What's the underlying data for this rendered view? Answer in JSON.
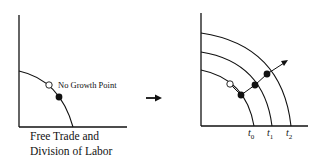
{
  "left_panel": {
    "point_label": "No Growth Point",
    "caption_line1": "Free Trade and",
    "caption_line2": "Division of Labor"
  },
  "right_panel": {
    "curve_labels": [
      {
        "base": "t",
        "sub": "0"
      },
      {
        "base": "t",
        "sub": "1"
      },
      {
        "base": "t",
        "sub": "2"
      }
    ]
  },
  "colors": {
    "ink": "#111111",
    "background": "#ffffff"
  }
}
